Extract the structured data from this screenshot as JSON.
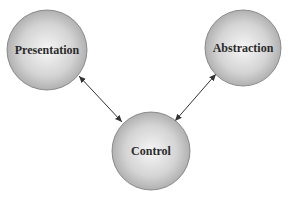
{
  "diagram": {
    "nodes": [
      {
        "id": "presentation",
        "label": "Presentation",
        "cx": 47,
        "cy": 50,
        "r": 40
      },
      {
        "id": "abstraction",
        "label": "Abstraction",
        "cx": 243,
        "cy": 48,
        "r": 38
      },
      {
        "id": "control",
        "label": "Control",
        "cx": 151,
        "cy": 151,
        "r": 39
      }
    ],
    "edges": [
      {
        "from": "presentation",
        "to": "control",
        "bidirectional": true
      },
      {
        "from": "abstraction",
        "to": "control",
        "bidirectional": true
      }
    ],
    "colors": {
      "node_center": "#f4f4f4",
      "node_edge": "#a8a8a8",
      "stroke": "#6a6a6a",
      "arrow": "#333333"
    }
  }
}
